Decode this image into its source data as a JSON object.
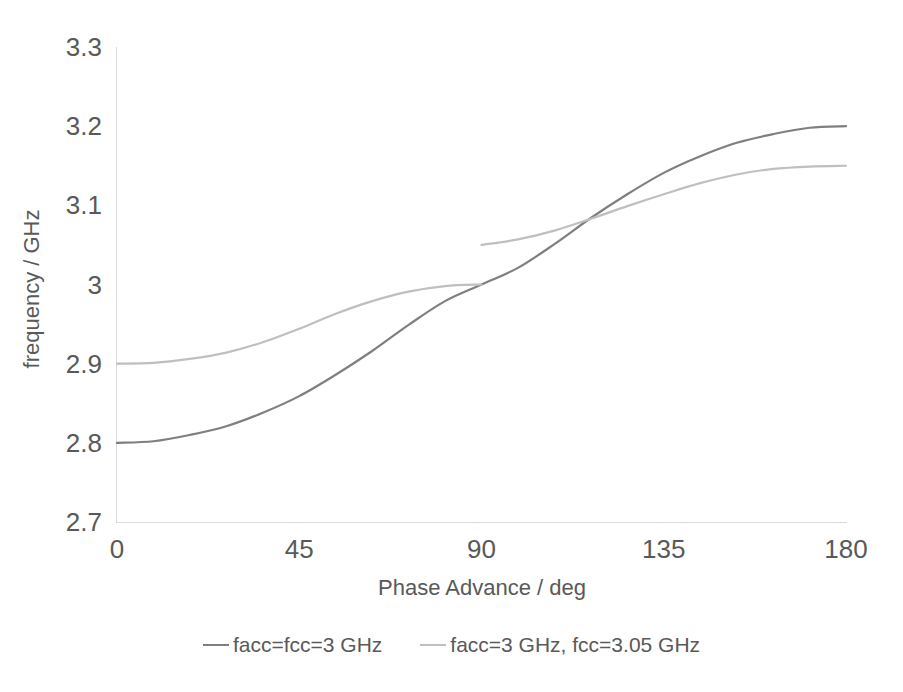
{
  "chart_data": {
    "type": "line",
    "title": "",
    "subtitle": "",
    "xlabel": "Phase Advance / deg",
    "ylabel": "frequency / GHz",
    "xlim": [
      0,
      180
    ],
    "ylim": [
      2.7,
      3.3
    ],
    "xticks": [
      "0",
      "45",
      "90",
      "135",
      "180"
    ],
    "xtick_values": [
      0,
      45,
      90,
      135,
      180
    ],
    "yticks": [
      "2.7",
      "2.8",
      "2.9",
      "3",
      "3.1",
      "3.2",
      "3.3"
    ],
    "ytick_values": [
      2.7,
      2.8,
      2.9,
      3.0,
      3.1,
      3.2,
      3.3
    ],
    "grid": false,
    "legend_position": "bottom",
    "series": [
      {
        "name": "facc=fcc=3 GHz",
        "color": "#7f7f7f",
        "x": [
          0,
          9,
          18,
          27,
          36,
          45,
          54,
          63,
          72,
          81,
          90,
          99,
          108,
          117,
          126,
          135,
          144,
          153,
          162,
          171,
          180
        ],
        "values": [
          2.8,
          2.802,
          2.81,
          2.821,
          2.838,
          2.859,
          2.886,
          2.916,
          2.949,
          2.979,
          3.0,
          3.021,
          3.051,
          3.084,
          3.114,
          3.141,
          3.162,
          3.179,
          3.19,
          3.198,
          3.2
        ]
      },
      {
        "name": "facc=3 GHz, fcc=3.05 GHz",
        "color": "#bfbfbf",
        "branches": [
          {
            "label": "lower-branch",
            "x": [
              0,
              9,
              18,
              27,
              36,
              45,
              54,
              63,
              72,
              81,
              90
            ],
            "values": [
              2.9,
              2.901,
              2.906,
              2.914,
              2.927,
              2.944,
              2.963,
              2.979,
              2.991,
              2.998,
              3.0
            ]
          },
          {
            "label": "upper-branch",
            "x": [
              90,
              99,
              108,
              117,
              126,
              135,
              144,
              153,
              162,
              171,
              180
            ],
            "values": [
              3.05,
              3.057,
              3.068,
              3.083,
              3.099,
              3.114,
              3.128,
              3.139,
              3.146,
              3.149,
              3.15
            ]
          }
        ]
      }
    ],
    "annotations": [
      {
        "text": "stop-band discontinuity at 90 deg",
        "x": 90,
        "y_from": 3.0,
        "y_to": 3.05
      }
    ]
  },
  "legend": {
    "items": [
      {
        "label": "facc=fcc=3 GHz",
        "color": "#7f7f7f"
      },
      {
        "label": "facc=3 GHz, fcc=3.05 GHz",
        "color": "#bfbfbf"
      }
    ]
  },
  "axes": {
    "x_title": "Phase Advance / deg",
    "y_title": "frequency / GHz"
  },
  "colors": {
    "series_dark": "#7f7f7f",
    "series_light": "#bfbfbf",
    "axis": "#d9d9d9",
    "text": "#595959",
    "background": "#ffffff"
  }
}
